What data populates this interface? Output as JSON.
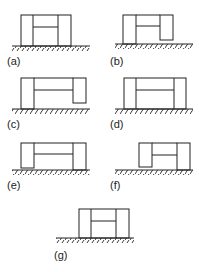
{
  "figure": {
    "panels": [
      {
        "id": "a",
        "label": "(a)",
        "variant": "both-columns-grounded"
      },
      {
        "id": "b",
        "label": "(b)",
        "variant": "right-column-raised"
      },
      {
        "id": "c",
        "label": "(c)",
        "variant": "right-column-raised-wide"
      },
      {
        "id": "d",
        "label": "(d)",
        "variant": "both-columns-grounded-wide"
      },
      {
        "id": "e",
        "label": "(e)",
        "variant": "left-column-raised"
      },
      {
        "id": "f",
        "label": "(f)",
        "variant": "left-column-raised-short"
      },
      {
        "id": "g",
        "label": "(g)",
        "variant": "both-columns-grounded-centered"
      }
    ]
  },
  "colors": {
    "line": "#222222",
    "background": "#ffffff"
  }
}
